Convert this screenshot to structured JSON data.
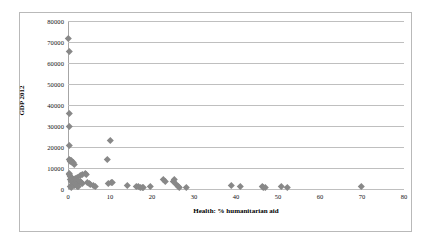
{
  "chart_data": {
    "type": "scatter",
    "title": "",
    "xlabel": "Health: % humanitarian aid",
    "ylabel": "GDP 2012",
    "xlim": [
      0,
      80
    ],
    "ylim": [
      0,
      80000
    ],
    "xticks": [
      0,
      10,
      20,
      30,
      40,
      50,
      60,
      70,
      80
    ],
    "yticks": [
      0,
      10000,
      20000,
      30000,
      40000,
      50000,
      60000,
      70000,
      80000
    ],
    "grid": "horizontal",
    "legend": "none",
    "marker": {
      "shape": "diamond",
      "color": "#888888",
      "size": 4.6
    },
    "series": [
      {
        "name": "Countries",
        "points": [
          [
            0.1,
            72000
          ],
          [
            0.2,
            65500
          ],
          [
            0.2,
            36000
          ],
          [
            0.2,
            30000
          ],
          [
            0.2,
            21000
          ],
          [
            0.3,
            14200
          ],
          [
            0.5,
            13800
          ],
          [
            0.6,
            13200
          ],
          [
            0.8,
            13500
          ],
          [
            1.0,
            12600
          ],
          [
            1.2,
            12900
          ],
          [
            1.4,
            11800
          ],
          [
            0.3,
            7400
          ],
          [
            0.4,
            6900
          ],
          [
            0.5,
            6200
          ],
          [
            0.7,
            5600
          ],
          [
            0.6,
            4400
          ],
          [
            0.9,
            3700
          ],
          [
            1.1,
            5200
          ],
          [
            1.3,
            4800
          ],
          [
            1.5,
            4200
          ],
          [
            1.7,
            5000
          ],
          [
            1.9,
            4600
          ],
          [
            2.1,
            5400
          ],
          [
            2.3,
            4100
          ],
          [
            2.6,
            3400
          ],
          [
            2.9,
            3900
          ],
          [
            3.2,
            3000
          ],
          [
            3.5,
            2600
          ],
          [
            1.0,
            2300
          ],
          [
            1.4,
            1800
          ],
          [
            1.8,
            2100
          ],
          [
            2.2,
            1500
          ],
          [
            2.5,
            1200
          ],
          [
            0.6,
            1400
          ],
          [
            0.9,
            900
          ],
          [
            3.0,
            6600
          ],
          [
            3.4,
            7200
          ],
          [
            4.0,
            7500
          ],
          [
            4.3,
            6900
          ],
          [
            4.6,
            3100
          ],
          [
            5.0,
            2500
          ],
          [
            5.4,
            2200
          ],
          [
            6.0,
            1600
          ],
          [
            6.5,
            1500
          ],
          [
            9.3,
            14200
          ],
          [
            10.0,
            23300
          ],
          [
            9.5,
            2700
          ],
          [
            10.2,
            3400
          ],
          [
            10.6,
            3200
          ],
          [
            14.0,
            1900
          ],
          [
            16.3,
            1300
          ],
          [
            16.8,
            1500
          ],
          [
            17.2,
            900
          ],
          [
            17.6,
            1000
          ],
          [
            18.0,
            800
          ],
          [
            19.5,
            1100
          ],
          [
            22.8,
            4500
          ],
          [
            23.2,
            3900
          ],
          [
            25.0,
            3800
          ],
          [
            25.4,
            4400
          ],
          [
            25.8,
            2300
          ],
          [
            26.2,
            1400
          ],
          [
            26.6,
            900
          ],
          [
            28.2,
            700
          ],
          [
            38.8,
            1600
          ],
          [
            41.0,
            1500
          ],
          [
            46.2,
            1300
          ],
          [
            46.6,
            800
          ],
          [
            46.9,
            700
          ],
          [
            50.7,
            1500
          ],
          [
            52.2,
            900
          ],
          [
            69.8,
            1200
          ]
        ]
      }
    ]
  }
}
